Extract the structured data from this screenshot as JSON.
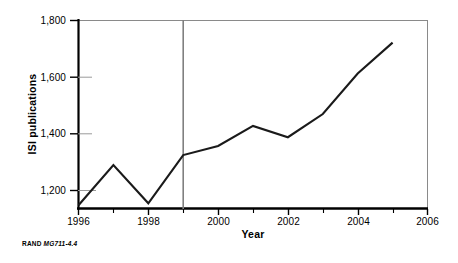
{
  "figure": {
    "credit_prefix": "RAND",
    "credit_number": "MG711-4.4"
  },
  "axes": {
    "y_title": "ISI publications",
    "x_title": "Year",
    "y_tick_labels": [
      "1,800",
      "1,600",
      "1,400",
      "1,200"
    ],
    "x_tick_labels": [
      "1996",
      "1998",
      "2000",
      "2002",
      "2004",
      "2006"
    ]
  },
  "colors": {
    "axis": "#000000",
    "series_line": "#1a1a1a",
    "reference_line": "#808080",
    "background": "#ffffff"
  },
  "chart_data": {
    "type": "line",
    "title": "",
    "xlabel": "Year",
    "ylabel": "ISI publications",
    "xlim": [
      1996,
      2006
    ],
    "ylim": [
      1140,
      1800
    ],
    "grid": false,
    "legend": "none",
    "x": [
      1996,
      1997,
      1998,
      1999,
      2000,
      2001,
      2002,
      2003,
      2004,
      2005
    ],
    "series": [
      {
        "name": "ISI publications",
        "values": [
          1148,
          1290,
          1155,
          1325,
          1357,
          1428,
          1388,
          1470,
          1613,
          1722
        ]
      }
    ],
    "x_ticks_major": [
      1996,
      1998,
      2000,
      2002,
      2004,
      2006
    ],
    "x_ticks_minor": [
      1997,
      1999,
      2001,
      2003,
      2005
    ],
    "y_ticks": [
      1200,
      1400,
      1600,
      1800
    ],
    "annotations": [
      {
        "type": "vline",
        "x": 1999,
        "label": "",
        "color": "#808080"
      }
    ]
  }
}
